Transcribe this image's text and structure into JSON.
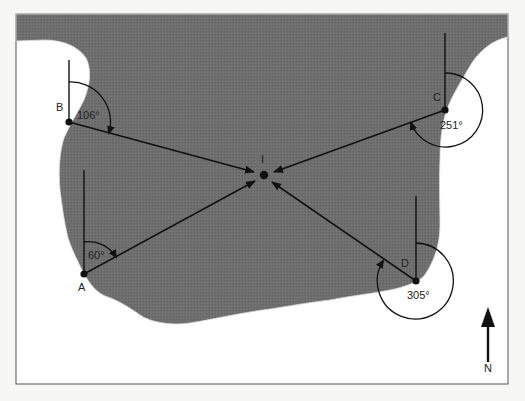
{
  "diagram": {
    "type": "compass-bearing-resection",
    "colors": {
      "background": "#f7f7f5",
      "land": "#6e6e6e",
      "water": "#ffffff",
      "ink": "#111111",
      "frame": "#555555"
    },
    "target": {
      "label": "I",
      "x": 264,
      "y": 175
    },
    "stations": [
      {
        "label": "A",
        "x": 84,
        "y": 274,
        "bearing": 60,
        "angle_label": "60°",
        "label_x": 78,
        "label_y": 291,
        "angle_x": 88,
        "angle_y": 259
      },
      {
        "label": "B",
        "x": 69,
        "y": 122,
        "bearing": 106,
        "angle_label": "106°",
        "label_x": 56,
        "label_y": 111,
        "angle_x": 77,
        "angle_y": 119
      },
      {
        "label": "C",
        "x": 445,
        "y": 110,
        "bearing": 251,
        "angle_label": "251°",
        "label_x": 433,
        "label_y": 101,
        "angle_x": 440,
        "angle_y": 129
      },
      {
        "label": "D",
        "x": 416,
        "y": 281,
        "bearing": 305,
        "angle_label": "305°",
        "label_x": 401,
        "label_y": 267,
        "angle_x": 407,
        "angle_y": 299
      }
    ],
    "north_arrow": {
      "label": "N",
      "x": 488,
      "y_top": 308,
      "y_bottom": 360,
      "label_y": 372
    }
  }
}
